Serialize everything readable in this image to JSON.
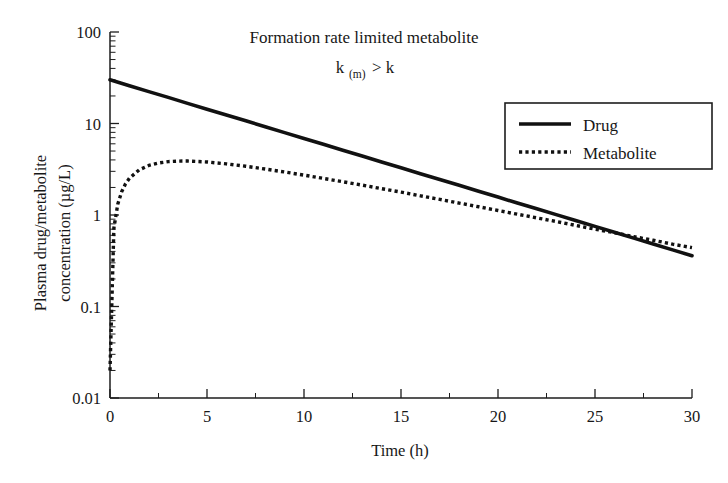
{
  "chart_data": {
    "type": "line",
    "title": "Formation rate limited metabolite",
    "subtitle": "k(m) > k",
    "subtitle_base": "k",
    "subtitle_sub": "(m)",
    "subtitle_rest": " > k",
    "xlabel": "Time (h)",
    "ylabel_line1": "Plasma drug/metabolite",
    "ylabel_line2": "concentration (µg/L)",
    "ylabel": "Plasma drug/metabolite concentration (µg/L)",
    "xlim": [
      0,
      30
    ],
    "ylim": [
      0.01,
      100
    ],
    "yscale": "log",
    "xscale": "linear",
    "grid": false,
    "legend_position": "upper right",
    "xticks": [
      0,
      5,
      10,
      15,
      20,
      25,
      30
    ],
    "xticklabels": [
      "0",
      "5",
      "10",
      "15",
      "20",
      "25",
      "30"
    ],
    "yticks": [
      0.01,
      0.1,
      1,
      10,
      100
    ],
    "yticklabels": [
      "0.01",
      "0.1",
      "1",
      "10",
      "100"
    ],
    "line_color": "#111111",
    "axis_color": "#1d1d1d",
    "background": "#ffffff",
    "series": [
      {
        "name": "Drug",
        "style": "solid",
        "x": [
          0,
          1,
          2,
          3,
          4,
          5,
          6,
          7,
          8,
          9,
          10,
          11,
          12,
          13,
          14,
          15,
          16,
          17,
          18,
          19,
          20,
          21,
          22,
          23,
          24,
          25,
          26,
          27,
          28,
          29,
          30
        ],
        "values": [
          30.0,
          25.9,
          22.3,
          19.3,
          16.6,
          14.3,
          12.4,
          10.7,
          9.22,
          7.95,
          6.86,
          5.92,
          5.11,
          4.41,
          3.8,
          3.28,
          2.83,
          2.44,
          2.11,
          1.82,
          1.57,
          1.35,
          1.17,
          1.01,
          0.87,
          0.751,
          0.647,
          0.559,
          0.482,
          0.416,
          0.359
        ]
      },
      {
        "name": "Metabolite",
        "style": "dotted",
        "x": [
          0,
          0.2,
          0.4,
          0.6,
          0.8,
          1,
          1.5,
          2,
          2.5,
          3,
          3.5,
          4,
          5,
          6,
          7,
          8,
          9,
          10,
          11,
          12,
          13,
          14,
          15,
          16,
          17,
          18,
          19,
          20,
          21,
          22,
          23,
          24,
          25,
          26,
          27,
          28,
          29,
          30
        ],
        "values": [
          0.02,
          0.72,
          1.31,
          1.79,
          2.19,
          2.52,
          3.11,
          3.48,
          3.7,
          3.83,
          3.88,
          3.89,
          3.8,
          3.62,
          3.41,
          3.18,
          2.95,
          2.73,
          2.51,
          2.31,
          2.12,
          1.94,
          1.78,
          1.62,
          1.48,
          1.35,
          1.23,
          1.12,
          1.02,
          0.93,
          0.85,
          0.77,
          0.7,
          0.64,
          0.58,
          0.53,
          0.48,
          0.44
        ],
        "peak_time": 3.8,
        "peak_value": 3.9,
        "end_value": 0.1
      }
    ],
    "legend": [
      {
        "label": "Drug",
        "style": "solid"
      },
      {
        "label": "Metabolite",
        "style": "dotted"
      }
    ]
  }
}
